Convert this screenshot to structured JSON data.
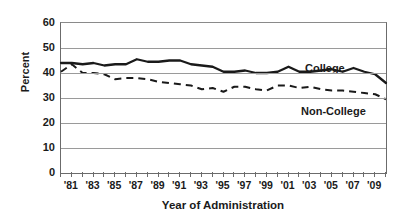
{
  "chart_data": {
    "type": "line",
    "title": "",
    "xlabel": "Year of Administration",
    "ylabel": "Percent",
    "ylim": [
      0,
      60
    ],
    "ytick_values": [
      60,
      50,
      40,
      30,
      20,
      10,
      0
    ],
    "ytick_labels": [
      "60",
      "50",
      "40",
      "30",
      "20",
      "10",
      "0"
    ],
    "grid": "horizontal",
    "legend_position": "inline-right",
    "x": [
      1980,
      1981,
      1982,
      1983,
      1984,
      1985,
      1986,
      1987,
      1988,
      1989,
      1990,
      1991,
      1992,
      1993,
      1994,
      1995,
      1996,
      1997,
      1998,
      1999,
      2000,
      2001,
      2002,
      2003,
      2004,
      2005,
      2006,
      2007,
      2008,
      2009,
      2010
    ],
    "xtick_labels": [
      "'81",
      "'83",
      "'85",
      "'87",
      "'89",
      "'91",
      "'93",
      "'95",
      "'97",
      "'99",
      "'01",
      "'03",
      "'05",
      "'07",
      "'09"
    ],
    "xtick_years": [
      1981,
      1983,
      1985,
      1987,
      1989,
      1991,
      1993,
      1995,
      1997,
      1999,
      2001,
      2003,
      2005,
      2007,
      2009
    ],
    "series": [
      {
        "name": "College",
        "style": "solid",
        "color": "#1a1a1a",
        "label_text": "College",
        "values": [
          44.0,
          44.0,
          43.5,
          44.0,
          43.0,
          43.5,
          43.5,
          45.5,
          44.5,
          44.5,
          45.0,
          45.0,
          43.5,
          43.0,
          42.5,
          40.5,
          40.5,
          41.0,
          40.0,
          40.0,
          40.5,
          42.5,
          40.5,
          40.5,
          41.0,
          41.5,
          40.5,
          42.0,
          40.5,
          39.5,
          36.0
        ]
      },
      {
        "name": "Non-College",
        "style": "dashed",
        "color": "#1a1a1a",
        "label_text": "Non-College",
        "values": [
          40.5,
          43.5,
          40.0,
          40.0,
          39.5,
          37.5,
          38.0,
          38.0,
          37.5,
          36.5,
          36.0,
          35.5,
          35.0,
          33.5,
          34.0,
          32.5,
          34.5,
          34.5,
          33.5,
          33.0,
          35.0,
          35.0,
          34.0,
          34.5,
          33.5,
          33.0,
          33.0,
          32.5,
          32.0,
          31.5,
          29.5
        ]
      }
    ]
  }
}
